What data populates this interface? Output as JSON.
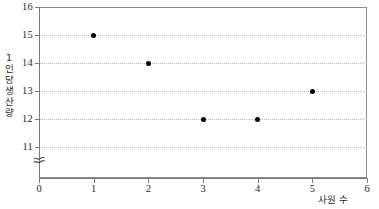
{
  "chart_data": {
    "type": "scatter",
    "title": "",
    "xlabel": "사원 수",
    "ylabel": "1인당 생산량",
    "x": [
      1,
      2,
      3,
      4,
      5
    ],
    "values": [
      15,
      14,
      12,
      12,
      13
    ],
    "points": [
      {
        "x": 1,
        "y": 15
      },
      {
        "x": 2,
        "y": 14
      },
      {
        "x": 3,
        "y": 12
      },
      {
        "x": 4,
        "y": 12
      },
      {
        "x": 5,
        "y": 13
      }
    ],
    "xlim": [
      0,
      6
    ],
    "ylim": [
      10.5,
      16
    ],
    "xticks": [
      0,
      1,
      2,
      3,
      4,
      5,
      6
    ],
    "yticks": [
      11,
      12,
      13,
      14,
      15,
      16
    ],
    "xtick_labels": [
      "0",
      "1",
      "2",
      "3",
      "4",
      "5",
      "6"
    ],
    "ytick_labels": [
      "11",
      "12",
      "13",
      "14",
      "15",
      "16"
    ],
    "grid": true,
    "grid_axis": "y",
    "grid_style": "dotted",
    "legend": null,
    "axis_break": {
      "axis": "y",
      "symbol": "≈",
      "below_value": 11
    },
    "colors": {
      "marker": "#000000",
      "grid": "#b9b9b9",
      "axis": "#7a7a7a",
      "frame": "#8c8c8c",
      "background": "#ffffff",
      "text": "#2a2a2a"
    }
  }
}
